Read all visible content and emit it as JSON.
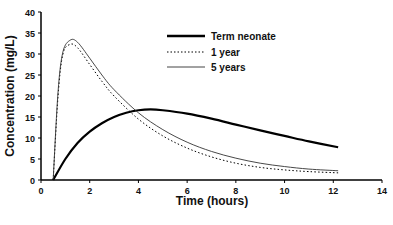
{
  "chart_data": {
    "type": "line",
    "title": "",
    "xlabel": "Time (hours)",
    "ylabel": "Concentration (mg/L)",
    "xlim": [
      0,
      14
    ],
    "ylim": [
      0,
      40
    ],
    "x_ticks": [
      0,
      2,
      4,
      6,
      8,
      10,
      12,
      14
    ],
    "y_ticks": [
      0,
      5,
      10,
      15,
      20,
      25,
      30,
      35,
      40
    ],
    "grid": false,
    "legend_position": "upper-right-inside",
    "series": [
      {
        "name": "Term neonate",
        "style": "thick-solid",
        "x": [
          0.5,
          1,
          1.5,
          2,
          2.5,
          3,
          3.5,
          4,
          4.5,
          5,
          6,
          7,
          8,
          9,
          10,
          11,
          12.2
        ],
        "values": [
          0,
          5.0,
          8.8,
          11.5,
          13.5,
          15.0,
          16.0,
          16.6,
          16.8,
          16.6,
          15.8,
          14.6,
          13.2,
          11.8,
          10.5,
          9.2,
          7.8
        ]
      },
      {
        "name": "1 year",
        "style": "dotted",
        "x": [
          0.5,
          0.7,
          0.9,
          1.2,
          1.5,
          2,
          2.5,
          3,
          4,
          5,
          6,
          7,
          8,
          9,
          10,
          11,
          12.2
        ],
        "values": [
          0,
          20,
          30,
          32.3,
          31.5,
          27.5,
          23.5,
          20.0,
          14.5,
          10.5,
          7.6,
          5.5,
          4.0,
          3.0,
          2.4,
          2.0,
          1.7
        ]
      },
      {
        "name": "5 years",
        "style": "thin-solid",
        "x": [
          0.5,
          0.7,
          0.9,
          1.2,
          1.5,
          2,
          2.5,
          3,
          4,
          5,
          6,
          7,
          8,
          9,
          10,
          11,
          12.2
        ],
        "values": [
          0,
          21,
          30.5,
          33.3,
          32.8,
          29.0,
          25.0,
          21.5,
          16.0,
          12.0,
          9.0,
          6.8,
          5.2,
          4.0,
          3.2,
          2.6,
          2.2
        ]
      }
    ]
  },
  "legend": {
    "items": [
      {
        "label": "Term neonate",
        "style": "thick-solid"
      },
      {
        "label": "1 year",
        "style": "dotted"
      },
      {
        "label": "5 years",
        "style": "thin-solid"
      }
    ]
  },
  "colors": {
    "line": "#000000",
    "background": "#ffffff",
    "text": "#111111"
  }
}
